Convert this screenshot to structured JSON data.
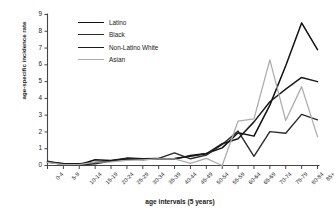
{
  "chart_data": {
    "type": "line",
    "title": "",
    "xlabel": "age intervals (5 years)",
    "ylabel": "age-specific incidence rate",
    "categories": [
      "0-4",
      "5-9",
      "10-14",
      "15-19",
      "20-24",
      "25-29",
      "30-34",
      "35-39",
      "40-44",
      "45-49",
      "50-54",
      "55-59",
      "60-64",
      "65-69",
      "70-74",
      "75-79",
      "80-84",
      "85+"
    ],
    "ylim": [
      0,
      9
    ],
    "yticks": [
      0,
      1,
      2,
      3,
      4,
      5,
      6,
      7,
      8,
      9
    ],
    "grid": false,
    "legend_position": "top-left",
    "series": [
      {
        "name": "Latino",
        "color": "#111111",
        "values": [
          0.22,
          0.06,
          0.05,
          0.34,
          0.3,
          0.44,
          0.4,
          0.42,
          0.38,
          0.6,
          0.72,
          1.05,
          1.95,
          1.75,
          3.6,
          5.95,
          8.5,
          6.9
        ]
      },
      {
        "name": "Black",
        "color": "#2b2b2b",
        "values": [
          0.25,
          0.1,
          0.02,
          0.1,
          0.26,
          0.42,
          0.36,
          0.42,
          0.75,
          0.4,
          0.62,
          1.25,
          2.05,
          0.55,
          2.02,
          1.92,
          3.05,
          2.72
        ]
      },
      {
        "name": "Non-Latino White",
        "color": "#1a1a1a",
        "values": [
          0.2,
          0.12,
          0.1,
          0.18,
          0.28,
          0.38,
          0.36,
          0.4,
          0.42,
          0.55,
          0.7,
          1.3,
          1.6,
          2.6,
          3.8,
          4.55,
          5.25,
          5.0
        ]
      },
      {
        "name": "Asian",
        "color": "#adadad",
        "values": [
          0.18,
          0.05,
          0.05,
          0.2,
          0.22,
          0.3,
          0.34,
          0.4,
          0.4,
          0.12,
          0.42,
          0.0,
          2.65,
          2.78,
          6.3,
          2.68,
          4.7,
          1.72
        ]
      }
    ]
  }
}
